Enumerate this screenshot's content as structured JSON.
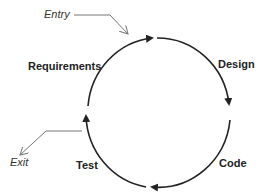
{
  "diagram": {
    "type": "cycle",
    "stages": [
      {
        "label": "Requirements"
      },
      {
        "label": "Design"
      },
      {
        "label": "Code"
      },
      {
        "label": "Test"
      }
    ],
    "entry_label": "Entry",
    "exit_label": "Exit",
    "flow": "clockwise",
    "colors": {
      "arc": "#222222",
      "pointer": "#666666",
      "text": "#222222"
    }
  }
}
